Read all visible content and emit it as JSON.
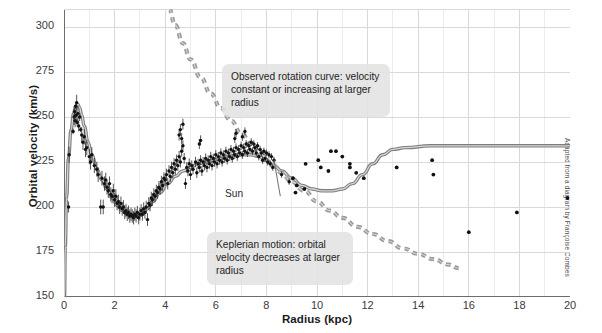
{
  "chart_data": {
    "type": "scatter",
    "title": "",
    "xlabel": "Radius (kpc)",
    "ylabel": "Orbital velocity (km/s)",
    "xlim": [
      0,
      20
    ],
    "ylim": [
      150,
      310
    ],
    "xticks": [
      0,
      2,
      4,
      6,
      8,
      10,
      12,
      14,
      16,
      18,
      20
    ],
    "yticks": [
      150,
      175,
      200,
      225,
      250,
      275,
      300
    ],
    "x_minor_step": 1,
    "grid": true,
    "legend_position": "none",
    "annotations": [
      {
        "name": "observed-rotation-curve",
        "text": "Observed rotation curve: velocity constant or increasing at larger radius",
        "x": 9.8,
        "y": 278
      },
      {
        "name": "keplerian-motion",
        "text": "Keplerian motion: orbital velocity decreases at larger radius",
        "x": 8.4,
        "y": 186
      },
      {
        "name": "sun-marker",
        "text": "Sun",
        "x": 8.3,
        "y": 211
      }
    ],
    "series": [
      {
        "name": "Observed rotation curve (model)",
        "type": "line",
        "style": "solid",
        "color": "#8f8f8f",
        "x": [
          0.02,
          0.05,
          0.1,
          0.18,
          0.28,
          0.38,
          0.46,
          0.55,
          0.62,
          0.7,
          0.8,
          0.95,
          1.1,
          1.3,
          1.5,
          1.7,
          1.9,
          2.1,
          2.3,
          2.5,
          2.7,
          2.9,
          3.1,
          3.3,
          3.5,
          3.8,
          4.1,
          4.4,
          4.7,
          5.0,
          5.3,
          5.6,
          5.9,
          6.2,
          6.5,
          6.8,
          7.1,
          7.4,
          7.7,
          8.0,
          8.3,
          8.6,
          9.0,
          9.4,
          9.8,
          10.2,
          10.6,
          11.0,
          11.4,
          11.8,
          12.2,
          12.6,
          13.0,
          13.5,
          14.5,
          16.0,
          18.0,
          20.0
        ],
        "y": [
          150,
          178,
          205,
          228,
          243,
          252,
          256,
          257,
          255,
          251,
          245,
          236,
          229,
          221,
          215,
          210,
          205,
          201,
          198,
          196,
          195,
          195,
          196,
          199,
          203,
          208,
          213,
          217,
          220,
          222,
          224,
          225,
          226,
          227,
          228,
          229,
          229,
          229,
          228,
          226,
          223,
          220,
          216,
          212,
          210,
          209,
          209,
          210,
          213,
          218,
          224,
          229,
          232,
          233,
          234,
          234,
          234,
          234
        ]
      },
      {
        "name": "Keplerian motion (expected)",
        "type": "line",
        "style": "dashed",
        "color": "#9a9a9a",
        "x": [
          4.15,
          4.4,
          4.7,
          5.0,
          5.4,
          5.8,
          6.2,
          6.6,
          7.0,
          7.4,
          7.8,
          8.2,
          8.6,
          9.0,
          9.5,
          10.0,
          10.5,
          11.0,
          11.6,
          12.2,
          12.8,
          13.4,
          14.0,
          14.6,
          15.2,
          15.6
        ],
        "y": [
          310,
          301,
          291,
          282,
          272,
          263,
          255,
          248,
          241,
          235,
          229,
          224,
          219,
          214,
          209,
          203,
          198,
          194,
          189,
          185,
          181,
          177,
          174,
          171,
          168,
          166
        ]
      },
      {
        "name": "Measured data points",
        "type": "scatter",
        "color": "#111111",
        "points": [
          [
            0.18,
            200
          ],
          [
            0.2,
            229
          ],
          [
            0.36,
            242
          ],
          [
            0.4,
            250
          ],
          [
            0.42,
            253
          ],
          [
            0.44,
            248
          ],
          [
            0.46,
            256
          ],
          [
            0.48,
            251
          ],
          [
            0.5,
            258
          ],
          [
            0.52,
            247
          ],
          [
            0.55,
            252
          ],
          [
            0.58,
            245
          ],
          [
            0.62,
            250
          ],
          [
            0.66,
            243
          ],
          [
            0.7,
            240
          ],
          [
            0.75,
            236
          ],
          [
            0.8,
            239
          ],
          [
            0.85,
            232
          ],
          [
            0.9,
            233
          ],
          [
            1.0,
            228
          ],
          [
            1.05,
            225
          ],
          [
            1.1,
            229
          ],
          [
            1.2,
            223
          ],
          [
            1.3,
            221
          ],
          [
            1.35,
            218
          ],
          [
            1.45,
            200
          ],
          [
            1.55,
            200
          ],
          [
            1.5,
            216
          ],
          [
            1.6,
            213
          ],
          [
            1.65,
            215
          ],
          [
            1.7,
            211
          ],
          [
            1.75,
            209
          ],
          [
            1.8,
            213
          ],
          [
            1.85,
            207
          ],
          [
            1.9,
            206
          ],
          [
            1.95,
            209
          ],
          [
            2.0,
            204
          ],
          [
            2.05,
            206
          ],
          [
            2.1,
            202
          ],
          [
            2.15,
            203
          ],
          [
            2.2,
            200
          ],
          [
            2.25,
            202
          ],
          [
            2.3,
            199
          ],
          [
            2.35,
            200
          ],
          [
            2.4,
            197
          ],
          [
            2.45,
            198
          ],
          [
            2.5,
            196
          ],
          [
            2.55,
            197
          ],
          [
            2.6,
            195
          ],
          [
            2.65,
            196
          ],
          [
            2.7,
            195
          ],
          [
            2.75,
            194
          ],
          [
            2.8,
            196
          ],
          [
            2.85,
            195
          ],
          [
            2.9,
            197
          ],
          [
            2.95,
            194
          ],
          [
            3.0,
            196
          ],
          [
            3.05,
            198
          ],
          [
            3.1,
            196
          ],
          [
            3.15,
            199
          ],
          [
            3.2,
            197
          ],
          [
            3.25,
            200
          ],
          [
            3.3,
            193
          ],
          [
            3.35,
            202
          ],
          [
            3.4,
            201
          ],
          [
            3.45,
            205
          ],
          [
            3.5,
            204
          ],
          [
            3.55,
            207
          ],
          [
            3.6,
            206
          ],
          [
            3.65,
            209
          ],
          [
            3.7,
            208
          ],
          [
            3.75,
            211
          ],
          [
            3.8,
            210
          ],
          [
            3.85,
            214
          ],
          [
            3.9,
            212
          ],
          [
            3.95,
            216
          ],
          [
            4.0,
            215
          ],
          [
            4.05,
            218
          ],
          [
            4.1,
            213
          ],
          [
            4.15,
            220
          ],
          [
            4.2,
            217
          ],
          [
            4.25,
            222
          ],
          [
            4.3,
            219
          ],
          [
            4.35,
            224
          ],
          [
            4.4,
            221
          ],
          [
            4.45,
            226
          ],
          [
            4.5,
            223
          ],
          [
            4.55,
            228
          ],
          [
            4.6,
            225
          ],
          [
            4.65,
            231
          ],
          [
            4.7,
            234
          ],
          [
            4.75,
            227
          ],
          [
            4.8,
            213
          ],
          [
            4.85,
            222
          ],
          [
            4.9,
            220
          ],
          [
            4.95,
            224
          ],
          [
            5.0,
            218
          ],
          [
            5.05,
            223
          ],
          [
            5.1,
            221
          ],
          [
            5.2,
            225
          ],
          [
            5.25,
            219
          ],
          [
            5.3,
            224
          ],
          [
            5.35,
            222
          ],
          [
            5.4,
            226
          ],
          [
            5.45,
            220
          ],
          [
            5.5,
            225
          ],
          [
            5.55,
            223
          ],
          [
            5.6,
            227
          ],
          [
            5.65,
            222
          ],
          [
            5.7,
            226
          ],
          [
            5.75,
            224
          ],
          [
            5.8,
            228
          ],
          [
            5.85,
            223
          ],
          [
            5.9,
            227
          ],
          [
            5.95,
            225
          ],
          [
            6.0,
            229
          ],
          [
            6.05,
            224
          ],
          [
            6.1,
            228
          ],
          [
            6.15,
            226
          ],
          [
            6.2,
            230
          ],
          [
            6.25,
            225
          ],
          [
            6.3,
            229
          ],
          [
            6.35,
            227
          ],
          [
            6.4,
            231
          ],
          [
            6.45,
            226
          ],
          [
            6.5,
            230
          ],
          [
            6.55,
            228
          ],
          [
            6.6,
            232
          ],
          [
            6.65,
            227
          ],
          [
            6.7,
            231
          ],
          [
            6.75,
            229
          ],
          [
            6.8,
            233
          ],
          [
            6.85,
            228
          ],
          [
            6.9,
            232
          ],
          [
            6.95,
            230
          ],
          [
            7.0,
            234
          ],
          [
            7.05,
            229
          ],
          [
            7.1,
            233
          ],
          [
            7.15,
            231
          ],
          [
            7.2,
            235
          ],
          [
            7.25,
            230
          ],
          [
            7.3,
            234
          ],
          [
            7.35,
            232
          ],
          [
            7.4,
            236
          ],
          [
            7.45,
            231
          ],
          [
            7.5,
            235
          ],
          [
            7.55,
            233
          ],
          [
            7.6,
            230
          ],
          [
            7.65,
            234
          ],
          [
            7.7,
            228
          ],
          [
            7.75,
            232
          ],
          [
            7.8,
            230
          ],
          [
            7.85,
            226
          ],
          [
            7.9,
            231
          ],
          [
            7.95,
            227
          ],
          [
            8.0,
            230
          ],
          [
            8.05,
            225
          ],
          [
            8.1,
            229
          ],
          [
            8.15,
            224
          ],
          [
            8.2,
            228
          ],
          [
            8.25,
            222
          ],
          [
            8.3,
            226
          ],
          [
            4.55,
            240
          ],
          [
            4.6,
            243
          ],
          [
            4.65,
            238
          ],
          [
            4.7,
            246
          ],
          [
            6.75,
            238
          ],
          [
            6.8,
            241
          ],
          [
            7.05,
            239
          ],
          [
            7.15,
            242
          ],
          [
            5.35,
            235
          ],
          [
            5.4,
            237
          ],
          [
            8.6,
            218
          ],
          [
            8.9,
            214
          ],
          [
            9.2,
            212
          ],
          [
            9.5,
            210
          ],
          [
            10.05,
            226
          ],
          [
            10.55,
            231
          ],
          [
            10.75,
            231
          ],
          [
            10.15,
            222
          ],
          [
            10.45,
            220
          ],
          [
            11.0,
            228
          ],
          [
            11.3,
            224
          ],
          [
            11.55,
            219
          ],
          [
            11.85,
            216
          ],
          [
            11.3,
            222
          ],
          [
            9.55,
            224
          ],
          [
            13.15,
            222
          ],
          [
            14.55,
            226
          ],
          [
            14.6,
            218
          ],
          [
            16.0,
            186
          ],
          [
            17.9,
            197
          ],
          [
            19.9,
            205
          ],
          [
            9.15,
            208
          ],
          [
            9.05,
            216
          ]
        ]
      }
    ]
  },
  "axis": {
    "ylabel": "Orbital velocity (km/s)",
    "xlabel": "Radius (kpc)",
    "ytick_labels": [
      "300",
      "275",
      "250",
      "225",
      "200",
      "175",
      "150"
    ],
    "xtick_labels": [
      "0",
      "2",
      "4",
      "6",
      "8",
      "10",
      "12",
      "14",
      "16",
      "18",
      "20"
    ]
  },
  "callouts": {
    "observed": "Observed rotation curve: velocity constant or increasing at larger radius",
    "keplerian": "Keplerian motion: orbital velocity decreases at larger radius",
    "sun": "Sun"
  },
  "credit": "Adapted from a diagram by Françoise Combes",
  "colors": {
    "grid": "#d9d9d9",
    "axis": "#6d6d6d",
    "model_curve": "#8f8f8f",
    "kepler_curve": "#9a9a9a",
    "points": "#111111",
    "callout_bg": "#e2e2e2",
    "text": "#1a1a1a"
  }
}
